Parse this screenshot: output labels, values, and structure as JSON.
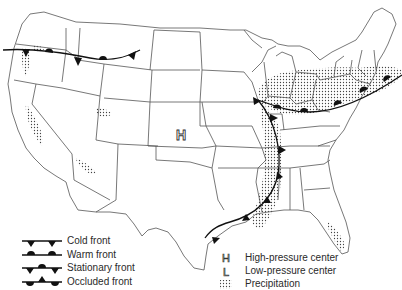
{
  "map": {
    "subject": "United States weather map",
    "high_pressure_symbol": "H",
    "colors": {
      "ink": "#111111",
      "border": "#555555",
      "precip_dot": "#444444",
      "background": "#ffffff"
    }
  },
  "legend": {
    "fronts": [
      {
        "label": "Cold front",
        "symbol": "cold-front"
      },
      {
        "label": "Warm front",
        "symbol": "warm-front"
      },
      {
        "label": "Stationary front",
        "symbol": "stationary-front"
      },
      {
        "label": "Occluded front",
        "symbol": "occluded-front"
      }
    ],
    "markers": [
      {
        "glyph": "H",
        "label": "High-pressure center"
      },
      {
        "glyph": "L",
        "label": "Low-pressure center"
      },
      {
        "glyph": "",
        "label": "Precipitation"
      }
    ]
  }
}
